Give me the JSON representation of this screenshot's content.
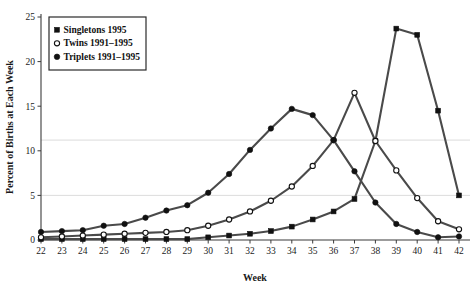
{
  "chart_data": {
    "type": "line",
    "title": "",
    "xlabel": "Week",
    "ylabel": "Percent of Births at Each Week",
    "x": [
      22,
      23,
      24,
      25,
      26,
      27,
      28,
      29,
      30,
      31,
      32,
      33,
      34,
      35,
      36,
      37,
      38,
      39,
      40,
      41,
      42
    ],
    "xlim": [
      22,
      42
    ],
    "ylim": [
      0,
      25
    ],
    "yticks": [
      0,
      5,
      10,
      15,
      20,
      25
    ],
    "xticks": [
      22,
      23,
      24,
      25,
      26,
      27,
      28,
      29,
      30,
      31,
      32,
      33,
      34,
      35,
      36,
      37,
      38,
      39,
      40,
      41,
      42
    ],
    "grid": "horizontal-faint",
    "legend_position": "upper-left",
    "series": [
      {
        "name": "Singletons 1995",
        "marker": "filled-square",
        "values": [
          0.1,
          0.1,
          0.1,
          0.1,
          0.1,
          0.1,
          0.1,
          0.1,
          0.3,
          0.5,
          0.7,
          1.0,
          1.5,
          2.3,
          3.2,
          4.6,
          11.1,
          23.7,
          23.0,
          14.5,
          5.0
        ]
      },
      {
        "name": "Twins 1991–1995",
        "marker": "open-circle",
        "values": [
          0.3,
          0.4,
          0.5,
          0.6,
          0.7,
          0.8,
          0.9,
          1.1,
          1.6,
          2.3,
          3.2,
          4.4,
          6.0,
          8.3,
          11.2,
          16.5,
          11.1,
          7.8,
          4.7,
          2.1,
          1.2
        ]
      },
      {
        "name": "Triplets 1991–1995",
        "marker": "filled-circle",
        "values": [
          0.9,
          1.0,
          1.1,
          1.6,
          1.8,
          2.5,
          3.3,
          3.9,
          5.3,
          7.4,
          10.1,
          12.5,
          14.7,
          14.0,
          11.2,
          7.7,
          4.2,
          1.8,
          0.9,
          0.3,
          0.4
        ]
      }
    ]
  },
  "legend": {
    "items": [
      {
        "label": "Singletons 1995",
        "marker": "filled-square"
      },
      {
        "label": "Twins 1991–1995",
        "marker": "open-circle"
      },
      {
        "label": "Triplets 1991–1995",
        "marker": "filled-circle"
      }
    ]
  },
  "colors": {
    "line": "#4a4a4a",
    "marker": "#111111",
    "axis": "#3b3b3b",
    "grid": "#d8d8d8",
    "background": "#ffffff"
  }
}
